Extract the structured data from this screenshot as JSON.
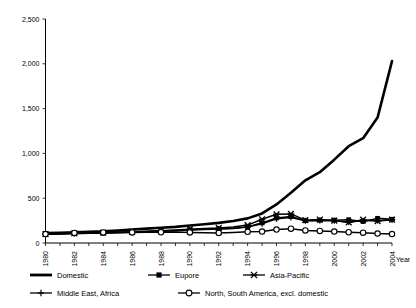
{
  "chart_data": {
    "type": "line",
    "title": "",
    "xlabel": "Year",
    "ylabel": "",
    "xlim": [
      1980,
      2004
    ],
    "ylim": [
      0,
      2500
    ],
    "grid": false,
    "legend_position": "bottom",
    "ytick_labels": [
      "0",
      "500",
      "1,000",
      "1,500",
      "2,000",
      "2,500"
    ],
    "ytick_values": [
      0,
      500,
      1000,
      1500,
      2000,
      2500
    ],
    "xtick_labels": [
      "1980",
      "1982",
      "1984",
      "1986",
      "1988",
      "1990",
      "1992",
      "1994",
      "1996",
      "1998",
      "2000",
      "2002",
      "2004"
    ],
    "xtick_values": [
      1980,
      1982,
      1984,
      1986,
      1988,
      1990,
      1992,
      1994,
      1996,
      1998,
      2000,
      2002,
      2004
    ],
    "x": [
      1980,
      1981,
      1982,
      1983,
      1984,
      1985,
      1986,
      1987,
      1988,
      1989,
      1990,
      1991,
      1992,
      1993,
      1994,
      1995,
      1996,
      1997,
      1998,
      1999,
      2000,
      2001,
      2002,
      2003,
      2004
    ],
    "series": [
      {
        "name": "Domestic",
        "marker": "none",
        "color": "#000000",
        "values": [
          110,
          115,
          120,
          125,
          130,
          140,
          150,
          160,
          170,
          180,
          195,
          210,
          225,
          245,
          275,
          330,
          430,
          560,
          700,
          790,
          930,
          1080,
          1170,
          1400,
          2030
        ]
      },
      {
        "name": "Eupore",
        "marker": "filled-square",
        "color": "#000000",
        "values": [
          100,
          103,
          107,
          110,
          113,
          118,
          123,
          128,
          133,
          140,
          148,
          155,
          158,
          165,
          180,
          225,
          280,
          295,
          250,
          255,
          255,
          260,
          240,
          275,
          265
        ]
      },
      {
        "name": "Asia-Pacific",
        "marker": "star",
        "color": "#000000",
        "values": [
          100,
          104,
          108,
          112,
          116,
          121,
          126,
          132,
          138,
          146,
          154,
          162,
          168,
          178,
          200,
          265,
          320,
          325,
          255,
          262,
          250,
          230,
          260,
          245,
          260
        ]
      },
      {
        "name": "Middle East, Africa",
        "marker": "plus",
        "color": "#000000",
        "values": [
          98,
          101,
          105,
          108,
          111,
          115,
          120,
          125,
          130,
          137,
          144,
          150,
          155,
          163,
          178,
          215,
          270,
          285,
          248,
          252,
          248,
          235,
          248,
          250,
          258
        ]
      },
      {
        "name": "North, South America, excl. domestic",
        "marker": "open-circle",
        "color": "#000000",
        "values": [
          100,
          110,
          112,
          118,
          118,
          120,
          118,
          120,
          120,
          122,
          118,
          115,
          112,
          118,
          125,
          128,
          150,
          160,
          140,
          135,
          128,
          120,
          115,
          105,
          100
        ]
      }
    ]
  },
  "legend": {
    "items": [
      {
        "label": "Domestic",
        "marker": "thick-line"
      },
      {
        "label": "Eupore",
        "marker": "filled-square"
      },
      {
        "label": "Asia-Pacific",
        "marker": "star"
      },
      {
        "label": "Middle East, Africa",
        "marker": "plus"
      },
      {
        "label": "North, South America, excl. domestic",
        "marker": "open-circle"
      }
    ]
  }
}
